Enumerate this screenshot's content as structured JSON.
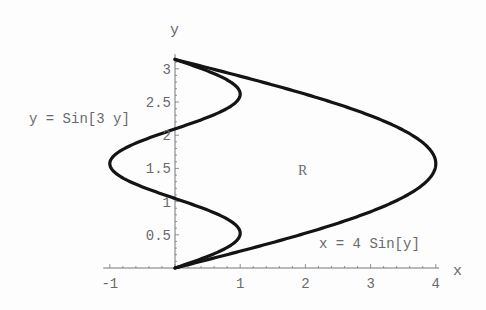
{
  "chart_data": {
    "type": "line",
    "title": "",
    "xlabel": "x",
    "ylabel": "y",
    "xlim": [
      -1.1,
      4.05
    ],
    "ylim": [
      0,
      3.22
    ],
    "grid": false,
    "legend": null,
    "x_ticks": [
      -1,
      1,
      2,
      3,
      4
    ],
    "x_tick_labels": [
      "-1",
      "1",
      "2",
      "3",
      "4"
    ],
    "y_ticks": [
      0.5,
      1,
      1.5,
      2,
      2.5,
      3
    ],
    "y_tick_labels": [
      "0.5",
      "1",
      "1.5",
      "2",
      "2.5",
      "3"
    ],
    "series": [
      {
        "name": "x = 4 Sin[y]",
        "param": "y",
        "y_range": [
          0,
          3.14159
        ],
        "points": [
          [
            0,
            0
          ],
          [
            1.236,
            0.314
          ],
          [
            2.351,
            0.628
          ],
          [
            3.236,
            0.942
          ],
          [
            3.804,
            1.257
          ],
          [
            4,
            1.571
          ],
          [
            3.804,
            1.885
          ],
          [
            3.236,
            2.199
          ],
          [
            2.351,
            2.513
          ],
          [
            1.236,
            2.827
          ],
          [
            0,
            3.142
          ]
        ]
      },
      {
        "name": "y = Sin[3 y]",
        "param": "y",
        "y_range": [
          0,
          3.14159
        ],
        "points": [
          [
            0,
            0
          ],
          [
            0.809,
            0.314
          ],
          [
            0.951,
            0.628
          ],
          [
            0.309,
            0.942
          ],
          [
            -0.588,
            1.257
          ],
          [
            -1,
            1.571
          ],
          [
            -0.588,
            1.885
          ],
          [
            0.309,
            2.199
          ],
          [
            0.951,
            2.513
          ],
          [
            0.809,
            2.827
          ],
          [
            0,
            3.142
          ]
        ]
      }
    ],
    "annotations": [
      {
        "text": "y = Sin[3 y]",
        "x": -1.5,
        "y": 2.2
      },
      {
        "text": "R",
        "x": 1.95,
        "y": 1.5
      },
      {
        "text": "x = 4 Sin[y]",
        "x": 2.25,
        "y": 0.4
      }
    ]
  },
  "labels": {
    "x_axis": "x",
    "y_axis": "y",
    "curve_left": "y = Sin[3 y]",
    "region": "R",
    "curve_right": "x = 4 Sin[y]"
  },
  "colors": {
    "curve": "#141414",
    "axis": "#777777",
    "text": "#6a6a6a",
    "background": "#fdfdfd"
  }
}
